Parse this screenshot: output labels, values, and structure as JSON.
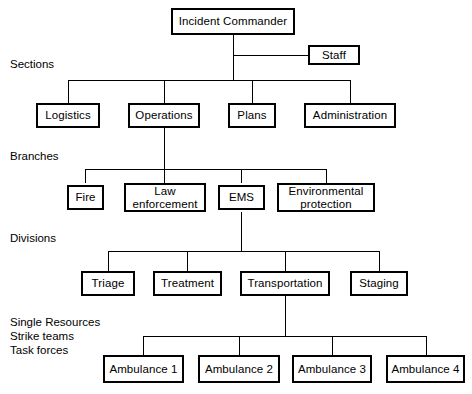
{
  "diagram": {
    "type": "org-chart",
    "line_color": "#000000",
    "box_border_color": "#000000",
    "background_color": "#ffffff",
    "text_color": "#000000"
  },
  "tier_labels": {
    "sections": "Sections",
    "branches": "Branches",
    "divisions": "Divisions",
    "resources": "Single Resources\nStrike teams\nTask forces"
  },
  "nodes": {
    "incident_commander": "Incident Commander",
    "staff": "Staff",
    "sections": [
      "Logistics",
      "Operations",
      "Plans",
      "Administration"
    ],
    "branches": [
      "Fire",
      "Law\nenforcement",
      "EMS",
      "Environmental\nprotection"
    ],
    "divisions": [
      "Triage",
      "Treatment",
      "Transportation",
      "Staging"
    ],
    "resources": [
      "Ambulance 1",
      "Ambulance 2",
      "Ambulance 3",
      "Ambulance 4"
    ]
  }
}
